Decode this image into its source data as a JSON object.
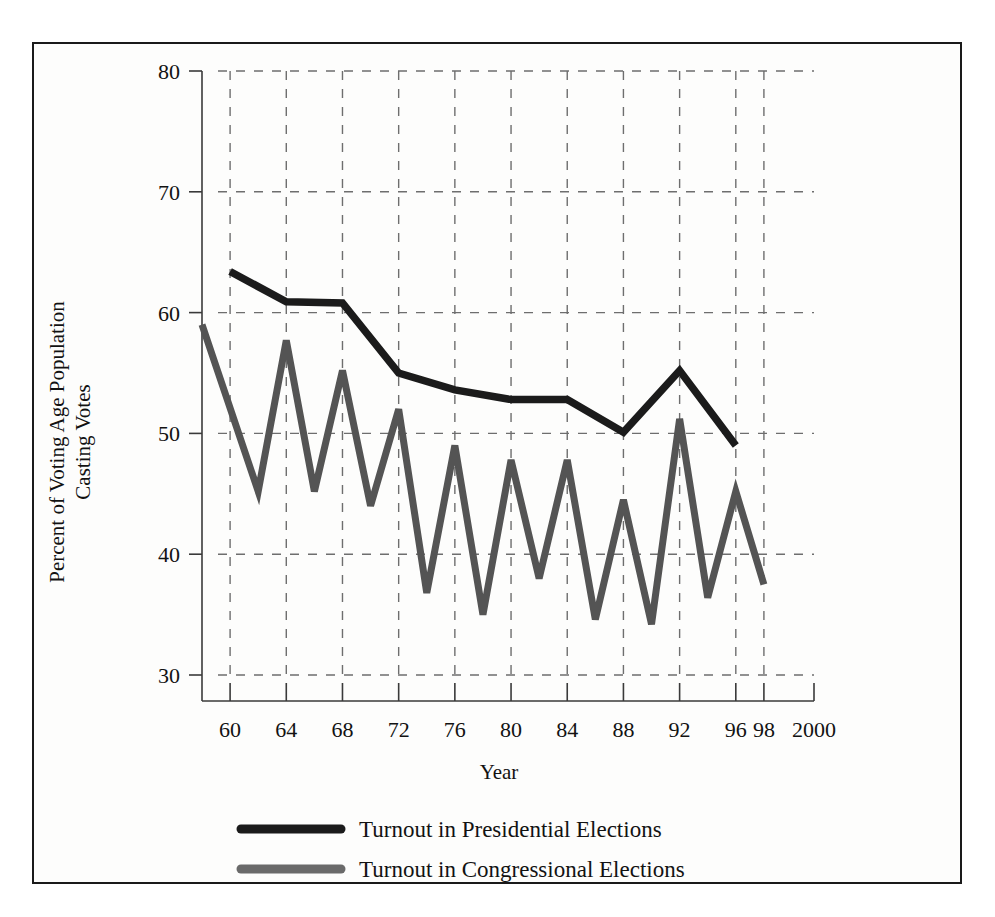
{
  "chart_data": {
    "type": "line",
    "title": "",
    "xlabel": "Year",
    "ylabel": "Percent of Voting Age Population Casting Votes",
    "ylabel_line1": "Percent of Voting Age Population",
    "ylabel_line2": "Casting Votes",
    "xlim": [
      1958,
      2000
    ],
    "ylim": [
      30,
      80
    ],
    "yticks": [
      30,
      40,
      50,
      60,
      70,
      80
    ],
    "ytick_labels": [
      "30",
      "40",
      "50",
      "60",
      "70",
      "80"
    ],
    "xticks": [
      1960,
      1964,
      1968,
      1972,
      1976,
      1980,
      1984,
      1988,
      1992,
      1996,
      1998,
      2000
    ],
    "xtick_labels": [
      "60",
      "64",
      "68",
      "72",
      "76",
      "80",
      "84",
      "88",
      "92",
      "96",
      "98",
      "2000"
    ],
    "grid": true,
    "grid_style": "dashed",
    "legend_position": "bottom",
    "series": [
      {
        "name": "Turnout in Presidential Elections",
        "color": "#1b1b1b",
        "x": [
          1960,
          1964,
          1968,
          1972,
          1976,
          1980,
          1984,
          1988,
          1992,
          1996
        ],
        "values": [
          63.4,
          60.9,
          60.8,
          55.0,
          53.6,
          52.8,
          52.8,
          50.1,
          55.2,
          49.0
        ]
      },
      {
        "name": "Turnout in Congressional Elections",
        "color": "#545454",
        "x": [
          1958,
          1962,
          1964,
          1966,
          1968,
          1970,
          1972,
          1974,
          1976,
          1978,
          1980,
          1982,
          1984,
          1986,
          1988,
          1990,
          1992,
          1994,
          1996,
          1998
        ],
        "values": [
          59.0,
          45.2,
          57.7,
          45.2,
          55.2,
          44.0,
          52.0,
          36.8,
          49.0,
          35.0,
          47.8,
          38.0,
          47.8,
          34.6,
          44.5,
          34.2,
          51.2,
          36.4,
          45.2,
          37.5
        ]
      }
    ]
  },
  "legend": {
    "items": [
      {
        "label": "Turnout in Presidential Elections",
        "color": "#1b1b1b"
      },
      {
        "label": "Turnout in Congressional Elections",
        "color": "#6a6a6a"
      }
    ]
  }
}
